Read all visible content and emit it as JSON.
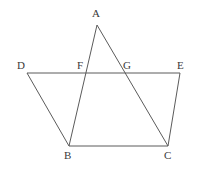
{
  "figure": {
    "type": "geometry-diagram",
    "width": 199,
    "height": 171,
    "background_color": "#ffffff",
    "stroke_color": "#5b5b5b",
    "stroke_width": 1,
    "label_color": "#3a3a3a",
    "points": {
      "A": {
        "label": "A",
        "x": 97,
        "y": 25,
        "label_x": 92,
        "label_y": 8
      },
      "B": {
        "label": "B",
        "x": 69,
        "y": 146,
        "label_x": 64,
        "label_y": 150
      },
      "C": {
        "label": "C",
        "x": 168,
        "y": 146,
        "label_x": 164,
        "label_y": 150
      },
      "D": {
        "label": "D",
        "x": 27,
        "y": 73,
        "label_x": 17,
        "label_y": 60
      },
      "E": {
        "label": "E",
        "x": 180,
        "y": 73,
        "label_x": 177,
        "label_y": 60
      },
      "F": {
        "label": "F",
        "x": 87,
        "y": 73,
        "label_x": 77,
        "label_y": 60
      },
      "G": {
        "label": "G",
        "x": 122,
        "y": 73,
        "label_x": 123,
        "label_y": 60
      }
    },
    "segments": [
      {
        "name": "segment-DE",
        "from": "D",
        "to": "E",
        "d": "M 27 73 L 180 73"
      },
      {
        "name": "segment-DB",
        "from": "D",
        "to": "B",
        "d": "M 27 73 L 69 146"
      },
      {
        "name": "segment-EC",
        "from": "E",
        "to": "C",
        "d": "M 180 73 L 168 146"
      },
      {
        "name": "segment-BC",
        "from": "B",
        "to": "C",
        "d": "M 69 146 L 168 146"
      },
      {
        "name": "segment-AB",
        "from": "A",
        "to": "B",
        "d": "M 97 25 L 69 146"
      },
      {
        "name": "segment-AC",
        "from": "A",
        "to": "C",
        "d": "M 97 25 L 168 146"
      }
    ],
    "labels_order": [
      "A",
      "D",
      "F",
      "G",
      "E",
      "B",
      "C"
    ]
  }
}
